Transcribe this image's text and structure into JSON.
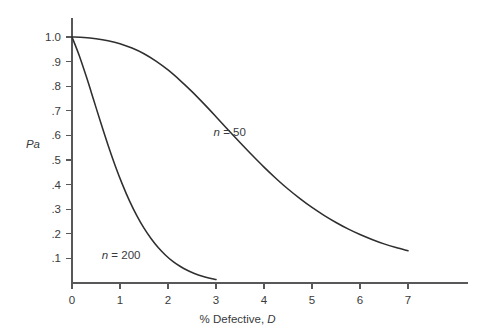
{
  "chart_data": {
    "type": "line",
    "title": "",
    "subtitle": "",
    "xlabel_prefix": "% Defective, ",
    "xlabel_symbol": "D",
    "ylabel": "Pa",
    "xlim": [
      0,
      7.6
    ],
    "ylim": [
      0,
      1.05
    ],
    "grid": false,
    "legend_position": "inline-annotation",
    "x_ticks": [
      "0",
      "1",
      "2",
      "3",
      "4",
      "5",
      "6",
      "7"
    ],
    "x_tick_values": [
      0,
      1,
      2,
      3,
      4,
      5,
      6,
      7
    ],
    "y_ticks": [
      ".1",
      ".2",
      ".3",
      ".4",
      ".5",
      ".6",
      ".7",
      ".8",
      ".9",
      "1.0"
    ],
    "y_tick_values": [
      0.1,
      0.2,
      0.3,
      0.4,
      0.5,
      0.6,
      0.7,
      0.8,
      0.9,
      1.0
    ],
    "series": [
      {
        "name": "n = 50",
        "label_prefix": "n",
        "label_suffix": " = 50",
        "color": "#2f2f31",
        "annotation_x": 2.95,
        "annotation_y": 0.615,
        "x": [
          0.0,
          0.25,
          0.5,
          0.75,
          1.0,
          1.25,
          1.5,
          1.75,
          2.0,
          2.25,
          2.5,
          2.75,
          3.0,
          3.25,
          3.5,
          3.75,
          4.0,
          4.25,
          4.5,
          4.75,
          5.0,
          5.25,
          5.5,
          5.75,
          6.0,
          6.25,
          6.5,
          6.75,
          7.0
        ],
        "y": [
          1.0,
          0.998,
          0.993,
          0.985,
          0.973,
          0.955,
          0.932,
          0.902,
          0.866,
          0.824,
          0.778,
          0.728,
          0.676,
          0.623,
          0.571,
          0.52,
          0.471,
          0.425,
          0.382,
          0.343,
          0.307,
          0.275,
          0.246,
          0.22,
          0.197,
          0.177,
          0.159,
          0.144,
          0.131
        ]
      },
      {
        "name": "n = 200",
        "label_prefix": "n",
        "label_suffix": " = 200",
        "color": "#2f2f31",
        "annotation_x": 0.62,
        "annotation_y": 0.112,
        "x": [
          0.0,
          0.15,
          0.3,
          0.45,
          0.6,
          0.75,
          0.9,
          1.05,
          1.2,
          1.35,
          1.5,
          1.65,
          1.8,
          1.95,
          2.1,
          2.25,
          2.4,
          2.55,
          2.7,
          2.85,
          3.0
        ],
        "y": [
          1.0,
          0.925,
          0.838,
          0.745,
          0.651,
          0.561,
          0.477,
          0.401,
          0.333,
          0.274,
          0.223,
          0.18,
          0.143,
          0.113,
          0.088,
          0.068,
          0.052,
          0.039,
          0.028,
          0.02,
          0.014
        ]
      }
    ]
  }
}
